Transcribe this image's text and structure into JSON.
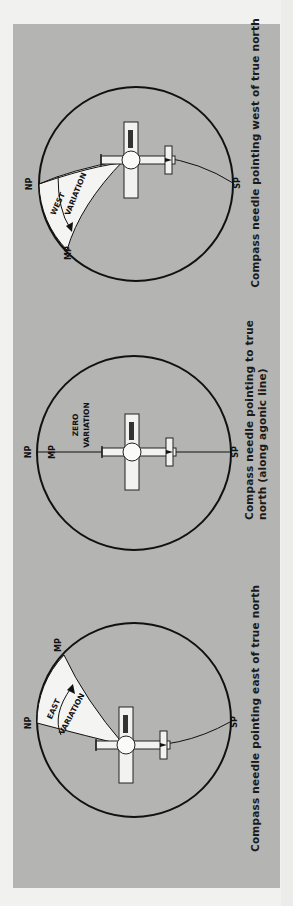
{
  "figure": {
    "panels": [
      {
        "id": "west",
        "labels": {
          "np": "NP",
          "mp": "MP",
          "sp": "SP",
          "variation_1": "WEST",
          "variation_2": "VARIATION"
        },
        "caption": [
          "Compass needle pointing west of true north"
        ]
      },
      {
        "id": "zero",
        "labels": {
          "np": "NP",
          "mp": "MP",
          "sp": "SP",
          "variation_1": "ZERO",
          "variation_2": "VARIATION"
        },
        "caption": [
          "Compass needle pointing to true",
          "north (along agonic line)"
        ]
      },
      {
        "id": "east",
        "labels": {
          "np": "NP",
          "mp": "MP",
          "sp": "SP",
          "variation_1": "EAST",
          "variation_2": "VARIATION"
        },
        "caption": [
          "Compass needle pointing east of true north"
        ]
      }
    ],
    "aircraft_registration": "N2826B",
    "colors": {
      "background": "#b4b4b2",
      "page": "#f1f1f0",
      "ink": "#1a1a1a",
      "wedge": "#f4f4f2"
    }
  }
}
